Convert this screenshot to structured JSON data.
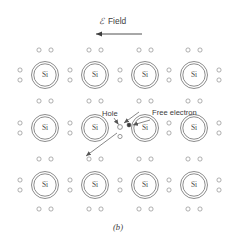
{
  "figure": {
    "caption": "(b)",
    "field": {
      "symbol": "ℰ",
      "label": "Field",
      "direction": "left",
      "arrow_name": "field-direction-arrow"
    },
    "lattice": {
      "atom_label": "Si",
      "rows": 3,
      "columns": 4,
      "column_x": [
        45,
        95,
        145,
        194
      ],
      "row_y": [
        75,
        128,
        185
      ],
      "atom_outer_radius": 13.5,
      "atom_inner_radius": 11.2,
      "bond_electron_radius": 2.1,
      "horizontal_pair_offset_y": 25,
      "horizontal_pair_dx": 6,
      "vertical_pair_offset_x": 25,
      "vertical_pair_dy": 6,
      "edge_vertical_pair_x": [
        20,
        219
      ]
    },
    "annotations": [
      {
        "name": "hole",
        "label": "Hole",
        "text_x": 102,
        "text_y": 116,
        "marker_x": 122,
        "marker_y": 127,
        "marker_type": "open-circle"
      },
      {
        "name": "free-electron",
        "label": "Free electron",
        "text_x": 152,
        "text_y": 115,
        "marker_x": 130,
        "marker_y": 125,
        "marker_type": "filled-dot"
      }
    ],
    "colors": {
      "background": "#ffffff",
      "atom_stroke": "#6e6e6e",
      "electron_stroke": "#8e8e8e",
      "free_electron_fill": "#3a3a3a",
      "text": "#3c3c3c",
      "leader": "#555555"
    }
  }
}
